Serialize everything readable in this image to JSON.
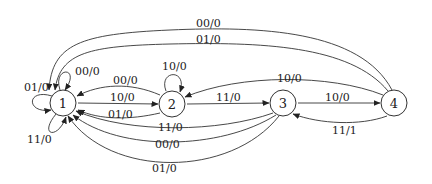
{
  "diagram": {
    "type": "finite-state-machine",
    "states": [
      {
        "id": "1",
        "label": "1",
        "x": 63,
        "y": 103
      },
      {
        "id": "2",
        "label": "2",
        "x": 172,
        "y": 104
      },
      {
        "id": "3",
        "label": "3",
        "x": 283,
        "y": 103
      },
      {
        "id": "4",
        "label": "4",
        "x": 394,
        "y": 103
      }
    ],
    "transitions": [
      {
        "from": "1",
        "to": "1",
        "label": "00/0"
      },
      {
        "from": "1",
        "to": "1",
        "label": "01/0"
      },
      {
        "from": "1",
        "to": "1",
        "label": "11/0"
      },
      {
        "from": "1",
        "to": "2",
        "label": "10/0"
      },
      {
        "from": "2",
        "to": "1",
        "label": "00/0"
      },
      {
        "from": "2",
        "to": "1",
        "label": "01/0"
      },
      {
        "from": "2",
        "to": "2",
        "label": "10/0"
      },
      {
        "from": "2",
        "to": "3",
        "label": "11/0"
      },
      {
        "from": "3",
        "to": "1",
        "label": "11/0"
      },
      {
        "from": "3",
        "to": "1",
        "label": "00/0"
      },
      {
        "from": "3",
        "to": "1",
        "label": "01/0"
      },
      {
        "from": "3",
        "to": "4",
        "label": "10/0"
      },
      {
        "from": "4",
        "to": "1",
        "label": "00/0"
      },
      {
        "from": "4",
        "to": "1",
        "label": "01/0"
      },
      {
        "from": "4",
        "to": "2",
        "label": "10/0"
      },
      {
        "from": "4",
        "to": "3",
        "label": "11/1"
      }
    ]
  }
}
